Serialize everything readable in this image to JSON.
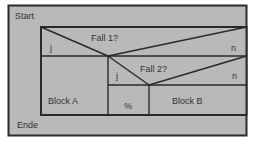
{
  "diagram": {
    "type": "nassi-shneiderman-structogram",
    "colors": {
      "fill": "#b9b9b9",
      "line": "#2a2a2a",
      "text": "#333333"
    },
    "start_label": "Start",
    "end_label": "Ende",
    "decision1": {
      "condition": "Fall 1?",
      "yes_label": "j",
      "no_label": "n",
      "yes_block": "Block A"
    },
    "decision2": {
      "condition": "Fall 2?",
      "yes_label": "j",
      "no_label": "n",
      "yes_block": "%",
      "no_block": "Block B"
    }
  }
}
